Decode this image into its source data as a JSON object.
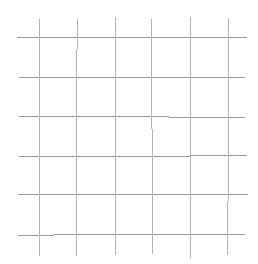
{
  "canvas": {
    "width": 258,
    "height": 264,
    "background_color": "#ffffff",
    "description": "grid-of-thin-gray-lines"
  },
  "grid": {
    "vertical_line_color": "#b3b3b3",
    "horizontal_line_color": "#9a9a9a",
    "line_width": 1,
    "vertical_count": 6,
    "horizontal_count": 6,
    "vertical_x": [
      39,
      77,
      115,
      152,
      190,
      228
    ],
    "vertical_y_start": 18,
    "vertical_y_end": 256,
    "horizontal_y": [
      38,
      78,
      117,
      156,
      195,
      235
    ],
    "horizontal_x_start": 18,
    "horizontal_x_end": 245,
    "vertical_spacing": 38,
    "horizontal_spacing": 39
  }
}
